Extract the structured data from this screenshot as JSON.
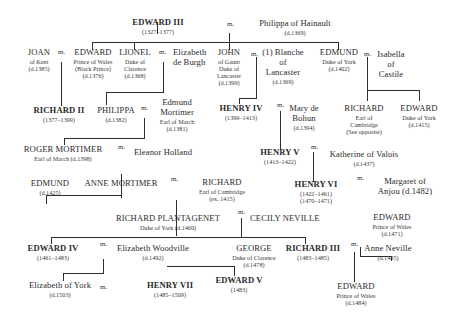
{
  "diagram": {
    "type": "family-tree",
    "marriage_marker": "m.",
    "people": {
      "edward3": {
        "name": "EDWARD III",
        "lines": [
          "(1327–1377)"
        ],
        "monarch": true
      },
      "philippa_hainault": {
        "name": "Philippa of Hainault",
        "lines": [
          "(d.1369)"
        ]
      },
      "joan_kent": {
        "name": "JOAN",
        "lines": [
          "of Kent",
          "(d.1385)"
        ]
      },
      "black_prince": {
        "name": "EDWARD",
        "lines": [
          "Prince of Wales",
          "(Black Prince)",
          "(d.1376)"
        ]
      },
      "lionel": {
        "name": "LIONEL",
        "lines": [
          "Duke of",
          "Clarence",
          "(d.1368)"
        ]
      },
      "elizabeth_burgh": {
        "name": "Elizabeth",
        "lines": [
          "de Burgh"
        ]
      },
      "john_gaunt": {
        "name": "JOHN",
        "lines": [
          "of Gaunt",
          "Duke of",
          "Lancaster",
          "(d.1399)"
        ]
      },
      "blanche": {
        "name": "(1) Blanche",
        "lines": [
          "of",
          "Lancaster",
          "(d.1369)"
        ]
      },
      "edmund_york": {
        "name": "EDMUND",
        "lines": [
          "Duke of York",
          "(d.1402)"
        ]
      },
      "isabella": {
        "name": "Isabella",
        "lines": [
          "of",
          "Castile"
        ]
      },
      "richard2": {
        "name": "RICHARD II",
        "lines": [
          "(1377–1399)"
        ],
        "monarch": true
      },
      "philippa": {
        "name": "PHILIPPA",
        "lines": [
          "(d.1382)"
        ]
      },
      "edmund_mortimer": {
        "name": "Edmund",
        "lines": [
          "Mortimer",
          "Earl of March",
          "(d.1381)"
        ]
      },
      "henry4": {
        "name": "HENRY IV",
        "lines": [
          "(1399–1413)"
        ],
        "monarch": true
      },
      "mary_bohun": {
        "name": "Mary de",
        "lines": [
          "Bohun",
          "(d.1394)"
        ]
      },
      "richard_cambridge_a": {
        "name": "RICHARD",
        "lines": [
          "Earl of",
          "Cambridge",
          "(See opposite)"
        ]
      },
      "edward_york": {
        "name": "EDWARD",
        "lines": [
          "Duke of York",
          "(d.1415)"
        ]
      },
      "roger_mortimer": {
        "name": "ROGER MORTIMER",
        "lines": [
          "Earl of March (d.1398)"
        ]
      },
      "eleanor_holland": {
        "name": "Eleanor Holland",
        "lines": []
      },
      "henry5": {
        "name": "HENRY V",
        "lines": [
          "(1413–1422)"
        ],
        "monarch": true
      },
      "katherine_valois": {
        "name": "Katherine of Valois",
        "lines": [
          "(d.1437)"
        ]
      },
      "edmund_m": {
        "name": "EDMUND",
        "lines": [
          "(d.1425)"
        ]
      },
      "anne_mortimer": {
        "name": "ANNE MORTIMER",
        "lines": []
      },
      "richard_cambridge_b": {
        "name": "RICHARD",
        "lines": [
          "Earl of Cambridge",
          "(ex. 1415)"
        ]
      },
      "henry6": {
        "name": "HENRY VI",
        "lines": [
          "(1422–1461)",
          "(1470–1471)"
        ],
        "monarch": true
      },
      "margaret_anjou": {
        "name": "Margaret of",
        "lines": [
          "Anjou (d.1482)"
        ]
      },
      "richard_plantagenet": {
        "name": "RICHARD PLANTAGENET",
        "lines": [
          "Duke of York (d.1460)"
        ]
      },
      "cecily_neville": {
        "name": "CECILY NEVILLE",
        "lines": []
      },
      "edward_wales_1471": {
        "name": "EDWARD",
        "lines": [
          "Prince of Wales",
          "(d.1471)"
        ]
      },
      "edward4": {
        "name": "EDWARD IV",
        "lines": [
          "(1461–1483)"
        ],
        "monarch": true
      },
      "elizabeth_woodville": {
        "name": "Elizabeth Woodville",
        "lines": [
          "(d.1492)"
        ]
      },
      "george": {
        "name": "GEORGE",
        "lines": [
          "Duke of Clarence",
          "(d.1478)"
        ]
      },
      "richard3": {
        "name": "RICHARD III",
        "lines": [
          "(1483–1485)"
        ],
        "monarch": true
      },
      "anne_neville": {
        "name": "Anne Neville",
        "lines": [
          "(d.1485)"
        ]
      },
      "elizabeth_york": {
        "name": "Elizabeth of York",
        "lines": [
          "(d.1503)"
        ]
      },
      "henry7": {
        "name": "HENRY VII",
        "lines": [
          "(1485–1509)"
        ],
        "monarch": true
      },
      "edward5": {
        "name": "EDWARD V",
        "lines": [
          "(1483)"
        ],
        "monarch": true
      },
      "edward_wales_1484": {
        "name": "EDWARD",
        "lines": [
          "Prince of Wales",
          "(d.1484)"
        ]
      }
    },
    "marriages": [
      [
        "edward3",
        "philippa_hainault"
      ],
      [
        "joan_kent",
        "black_prince"
      ],
      [
        "lionel",
        "elizabeth_burgh"
      ],
      [
        "john_gaunt",
        "blanche"
      ],
      [
        "edmund_york",
        "isabella"
      ],
      [
        "philippa",
        "edmund_mortimer"
      ],
      [
        "henry4",
        "mary_bohun"
      ],
      [
        "roger_mortimer",
        "eleanor_holland"
      ],
      [
        "henry5",
        "katherine_valois"
      ],
      [
        "anne_mortimer",
        "richard_cambridge_b"
      ],
      [
        "henry6",
        "margaret_anjou"
      ],
      [
        "richard_plantagenet",
        "cecily_neville"
      ],
      [
        "edward4",
        "elizabeth_woodville"
      ],
      [
        "richard3",
        "anne_neville"
      ],
      [
        "elizabeth_york",
        "henry7"
      ]
    ]
  }
}
